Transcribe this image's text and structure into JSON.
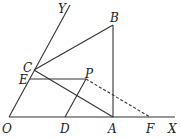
{
  "diagram": {
    "stroke_color": "#333333",
    "background": "#ffffff",
    "points": {
      "O": {
        "label": "O",
        "x": 9,
        "y": 117,
        "lx": 2,
        "ly": 133
      },
      "X": {
        "label": "X",
        "x": 175,
        "y": 117,
        "lx": 168,
        "ly": 133
      },
      "Y": {
        "label": "Y",
        "x": 70,
        "y": 5,
        "lx": 58,
        "ly": 13
      },
      "B": {
        "label": "B",
        "x": 113,
        "y": 25,
        "lx": 110,
        "ly": 22
      },
      "C": {
        "label": "C",
        "x": 34,
        "y": 70,
        "lx": 23,
        "ly": 72
      },
      "E": {
        "label": "E",
        "x": 30,
        "y": 79,
        "lx": 19,
        "ly": 84
      },
      "P": {
        "label": "P",
        "x": 86,
        "y": 79,
        "lx": 85,
        "ly": 78
      },
      "D": {
        "label": "D",
        "x": 65,
        "y": 117,
        "lx": 60,
        "ly": 133
      },
      "A": {
        "label": "A",
        "x": 113,
        "y": 117,
        "lx": 108,
        "ly": 133
      },
      "F": {
        "label": "F",
        "x": 150,
        "y": 117,
        "lx": 146,
        "ly": 133
      }
    },
    "segments": [
      {
        "from": "O",
        "to": "X",
        "style": "solid"
      },
      {
        "from": "O",
        "to": "Y",
        "style": "solid"
      },
      {
        "from": "C",
        "to": "B",
        "style": "solid"
      },
      {
        "from": "B",
        "to": "A",
        "style": "solid"
      },
      {
        "from": "C",
        "to": "A",
        "style": "solid"
      },
      {
        "from": "E",
        "to": "P",
        "style": "solid"
      },
      {
        "from": "D",
        "to": "P",
        "style": "solid"
      },
      {
        "from": "P",
        "to": "F",
        "style": "dashed"
      }
    ]
  }
}
